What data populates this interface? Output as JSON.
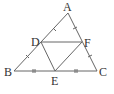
{
  "diagram": {
    "points": {
      "A": {
        "label": "A",
        "x": 68,
        "y": 13
      },
      "B": {
        "label": "B",
        "x": 14,
        "y": 71
      },
      "C": {
        "label": "C",
        "x": 97,
        "y": 71
      },
      "D": {
        "label": "D",
        "x": 41,
        "y": 42
      },
      "E": {
        "label": "E",
        "x": 55,
        "y": 71
      },
      "F": {
        "label": "F",
        "x": 82,
        "y": 42
      }
    },
    "segments": [
      "AB",
      "BC",
      "CA",
      "DF",
      "DE",
      "EF"
    ],
    "tick_marks": {
      "AD_DB": 1,
      "AF_FC": 1,
      "BE_EC": 2
    },
    "stroke_color": "#666666"
  }
}
